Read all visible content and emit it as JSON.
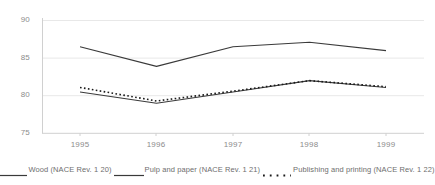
{
  "chart_data": {
    "type": "line",
    "title": "",
    "subtitle": "",
    "xlabel": "",
    "ylabel": "",
    "categories": [
      "1995",
      "1996",
      "1997",
      "1998",
      "1999"
    ],
    "x": [
      1995,
      1996,
      1997,
      1998,
      1999
    ],
    "ylim": [
      75,
      90
    ],
    "yticks": [
      75,
      80,
      85,
      90
    ],
    "ytick_labels": [
      "75",
      "80",
      "85",
      "90"
    ],
    "xtick_labels": [
      "1995",
      "1996",
      "1997",
      "1998",
      "1999"
    ],
    "grid": "horizontal",
    "legend_position": "bottom",
    "series": [
      {
        "name": "Wood (NACE Rev. 1 20)",
        "style": "solid",
        "color": "#3a3a3a",
        "values": [
          86.5,
          83.9,
          86.5,
          87.1,
          86.0
        ]
      },
      {
        "name": "Pulp and paper (NACE Rev. 1 21)",
        "style": "solid",
        "color": "#3a3a3a",
        "values": [
          80.5,
          79.0,
          80.5,
          82.0,
          81.1
        ]
      },
      {
        "name": "Publishing and printing (NACE Rev. 1 22)",
        "style": "dotted",
        "color": "#1a1a1a",
        "values": [
          81.1,
          79.3,
          80.6,
          82.0,
          81.2
        ]
      }
    ]
  },
  "axis": {
    "ytick_0": "75",
    "ytick_1": "80",
    "ytick_2": "85",
    "ytick_3": "90",
    "xtick_0": "1995",
    "xtick_1": "1996",
    "xtick_2": "1997",
    "xtick_3": "1998",
    "xtick_4": "1999"
  },
  "legend": {
    "item_0": "Wood (NACE Rev. 1 20)",
    "item_1": "Pulp and paper (NACE Rev. 1 21)",
    "item_2": "Publishing and printing (NACE Rev. 1 22)"
  },
  "colors": {
    "series_line": "#3a3a3a",
    "series_dotted": "#1a1a1a",
    "gridline": "#e8e8e8",
    "axis": "#d0d0d0",
    "tick_text": "#8c8c8c",
    "legend_text": "#6e6e6e",
    "background": "#ffffff"
  }
}
